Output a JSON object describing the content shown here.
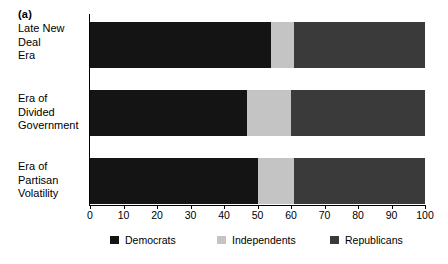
{
  "panel": {
    "label": "(a)"
  },
  "chart_data": {
    "type": "bar",
    "orientation": "horizontal",
    "stacked": true,
    "normalized_percent": true,
    "title": "(a)",
    "xlabel": "",
    "ylabel": "",
    "xlim": [
      0,
      100
    ],
    "ylim": null,
    "grid": false,
    "legend_position": "bottom",
    "categories": [
      "Late New Deal Era",
      "Era of Divided Government",
      "Era of Partisan Volatility"
    ],
    "category_lines": [
      [
        "Late New Deal",
        "Era"
      ],
      [
        "Era of Divided",
        "Government"
      ],
      [
        "Era of Partisan",
        "Volatility"
      ]
    ],
    "series": [
      {
        "name": "Democrats",
        "color": "#141414",
        "values": [
          54,
          47,
          50
        ]
      },
      {
        "name": "Independents",
        "color": "#c4c4c4",
        "values": [
          7,
          13,
          11
        ]
      },
      {
        "name": "Republicans",
        "color": "#3a3a3a",
        "values": [
          39,
          40,
          39
        ]
      }
    ],
    "cumulative_boundaries": [
      [
        54,
        61
      ],
      [
        47,
        60
      ],
      [
        50,
        61
      ]
    ],
    "xticks": [
      0,
      10,
      20,
      30,
      40,
      50,
      60,
      70,
      80,
      90,
      100
    ],
    "xtick_labels": [
      "0",
      "10",
      "20",
      "30",
      "40",
      "50",
      "60",
      "70",
      "80",
      "90",
      "100"
    ]
  },
  "legend": {
    "items": [
      {
        "label": "Democrats",
        "color": "#141414"
      },
      {
        "label": "Independents",
        "color": "#c4c4c4"
      },
      {
        "label": "Republicans",
        "color": "#3a3a3a"
      }
    ]
  }
}
